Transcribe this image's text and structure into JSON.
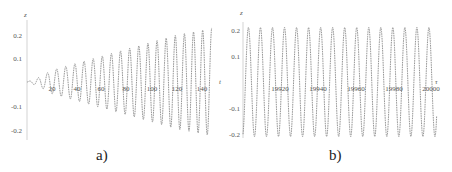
{
  "chart_data": [
    {
      "type": "line",
      "panel": "a",
      "title": "",
      "xlabel": "t",
      "ylabel": "z",
      "xlim": [
        0,
        150
      ],
      "ylim": [
        -0.25,
        0.25
      ],
      "xticks": [
        20,
        40,
        60,
        80,
        100,
        120,
        140
      ],
      "yticks": [
        -0.2,
        -0.1,
        0.1,
        0.2
      ],
      "grid": false,
      "description": "Oscillation with linearly growing amplitude; period ~7.3, amplitude grows from ~0 at t=0 to ~0.23 at t=148",
      "series": [
        {
          "name": "z(t)",
          "style": "dashed gray",
          "period": 7.3,
          "amplitude_envelope": {
            "t": [
              0,
              10,
              20,
              40,
              60,
              80,
              100,
              120,
              140,
              148
            ],
            "amp": [
              0.0,
              0.02,
              0.05,
              0.08,
              0.11,
              0.14,
              0.17,
              0.2,
              0.22,
              0.23
            ]
          }
        }
      ],
      "caption": "a)"
    },
    {
      "type": "line",
      "panel": "b",
      "title": "",
      "xlabel": "t",
      "ylabel": "z",
      "xlim": [
        19900,
        20003
      ],
      "ylim": [
        -0.22,
        0.22
      ],
      "xticks": [
        19920,
        19940,
        19960,
        19980,
        20000
      ],
      "yticks": [
        -0.2,
        -0.1,
        0.1,
        0.2
      ],
      "grid": false,
      "description": "Steady-state periodic oscillation with constant amplitude ~0.21, about 16 cycles over 100 time units",
      "series": [
        {
          "name": "z(t)",
          "style": "dashed gray",
          "period": 6.4,
          "amplitude": 0.21
        }
      ],
      "caption": "b)"
    }
  ],
  "panels": {
    "a": {
      "ylabel": "z",
      "xlabel": "t",
      "yticks": [
        "0.2",
        "0.1",
        "-0.1",
        "-0.2"
      ],
      "xticks": [
        "20",
        "40",
        "60",
        "80",
        "100",
        "120",
        "140"
      ],
      "caption": "a)"
    },
    "b": {
      "ylabel": "z",
      "xlabel": "τ",
      "yticks": [
        "0.2",
        "0.1",
        "-0.1",
        "-0.2"
      ],
      "xticks": [
        "19920",
        "19940",
        "19960",
        "19980",
        "20000"
      ],
      "caption": "b)"
    }
  },
  "colors": {
    "curve": "#8a8a8a",
    "axis": "#bdbdbd",
    "text": "#444444"
  }
}
